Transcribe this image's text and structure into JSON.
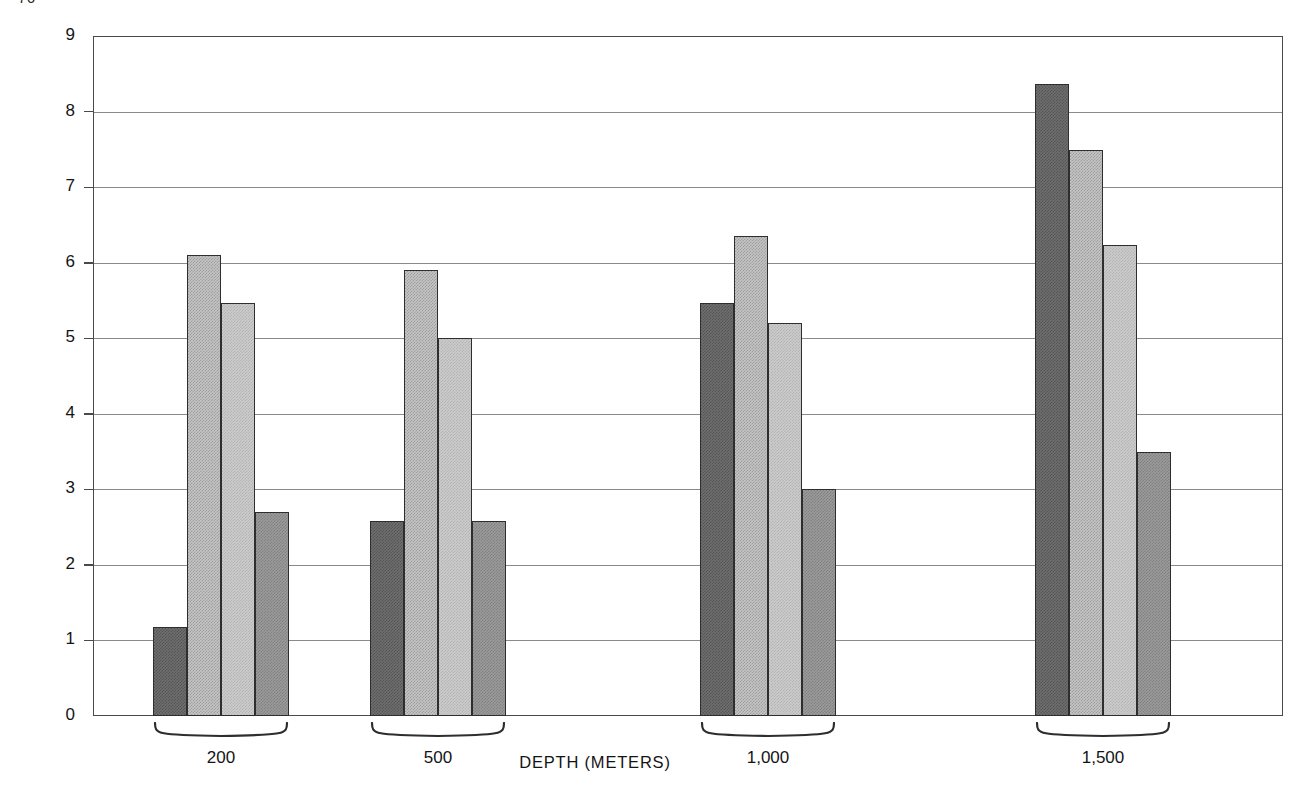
{
  "folio": "76",
  "chart_data": {
    "type": "bar",
    "title": "",
    "xlabel": "DEPTH (METERS)",
    "ylabel": "TIME (MINUTES)",
    "categories": [
      "200",
      "500",
      "1,000",
      "1,500"
    ],
    "yticks": [
      "0",
      "1",
      "2",
      "3",
      "4",
      "5",
      "6",
      "7",
      "8",
      "9"
    ],
    "ylim": [
      0,
      9
    ],
    "grid": true,
    "legend": "none",
    "series": [
      {
        "name": "series-1",
        "shade": "#6e6e6e",
        "values": [
          1.18,
          2.58,
          5.47,
          8.37
        ]
      },
      {
        "name": "series-2",
        "shade": "#c4c4c4",
        "values": [
          6.1,
          5.9,
          6.35,
          7.49
        ]
      },
      {
        "name": "series-3",
        "shade": "#cccccc",
        "values": [
          5.47,
          5.0,
          5.2,
          6.23
        ]
      },
      {
        "name": "series-4",
        "shade": "#9b9b9b",
        "values": [
          2.7,
          2.58,
          3.0,
          3.5
        ]
      }
    ],
    "group_positions_px": [
      153,
      370,
      700,
      1035
    ],
    "bar_width_px": 34
  }
}
